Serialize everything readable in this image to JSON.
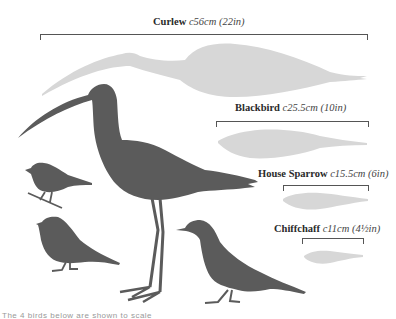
{
  "colors": {
    "silhouette_dark": "#5b5b5b",
    "silhouette_light": "#d7d7d7",
    "bracket": "#555555"
  },
  "birds": [
    {
      "name": "Curlew",
      "size_cm": "c56cm",
      "size_in": "(22in)"
    },
    {
      "name": "Blackbird",
      "size_cm": "c25.5cm",
      "size_in": "(10in)"
    },
    {
      "name": "House Sparrow",
      "size_cm": "c15.5cm",
      "size_in": "(6in)"
    },
    {
      "name": "Chiffchaff",
      "size_cm": "c11cm",
      "size_in": "(4½in)"
    }
  ],
  "caption": "The 4 birds below are shown to scale"
}
